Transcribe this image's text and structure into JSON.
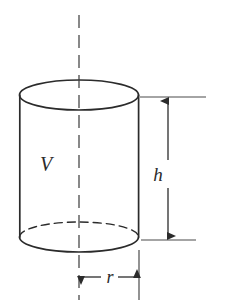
{
  "figure": {
    "type": "geometry-diagram",
    "shape": "cylinder",
    "background_color": "#ffffff",
    "stroke_color": "#2b2b2b",
    "label_color": "#2b2b2b"
  },
  "labels": {
    "volume": "V",
    "height": "h",
    "radius": "r"
  },
  "geometry": {
    "canvas": {
      "width": 231,
      "height": 307
    },
    "cylinder": {
      "center_x": 79,
      "left_x": 20,
      "right_x": 139,
      "radius_x": 59.5,
      "radius_y": 15,
      "top_ellipse_cy": 95,
      "bottom_ellipse_cy": 237,
      "body_height": 142
    },
    "axis_line": {
      "x": 79,
      "y_top": 15,
      "y_bottom": 300
    },
    "height_dimension": {
      "arrow_x": 168,
      "y_top": 97,
      "y_bottom": 240,
      "extension_top": {
        "x1": 140,
        "x2": 206,
        "y": 97
      },
      "extension_bottom": {
        "x1": 141,
        "x2": 196,
        "y": 240
      },
      "label_x": 158,
      "label_y": 175
    },
    "radius_dimension": {
      "y": 277,
      "x_left": 79,
      "x_right": 139,
      "label_x": 110,
      "label_y": 282,
      "extension_left": {
        "x": 79,
        "y1": 252,
        "y2": 300
      },
      "extension_right": {
        "x": 139,
        "y1": 252,
        "y2": 300
      }
    },
    "volume_label": {
      "x": 46,
      "y": 165
    }
  },
  "style": {
    "outline_stroke_width": 1.6,
    "dimension_stroke_width": 1.2,
    "axis_dash": "13 7",
    "hidden_edge_dash": "8 5",
    "label_font_size": 19
  }
}
